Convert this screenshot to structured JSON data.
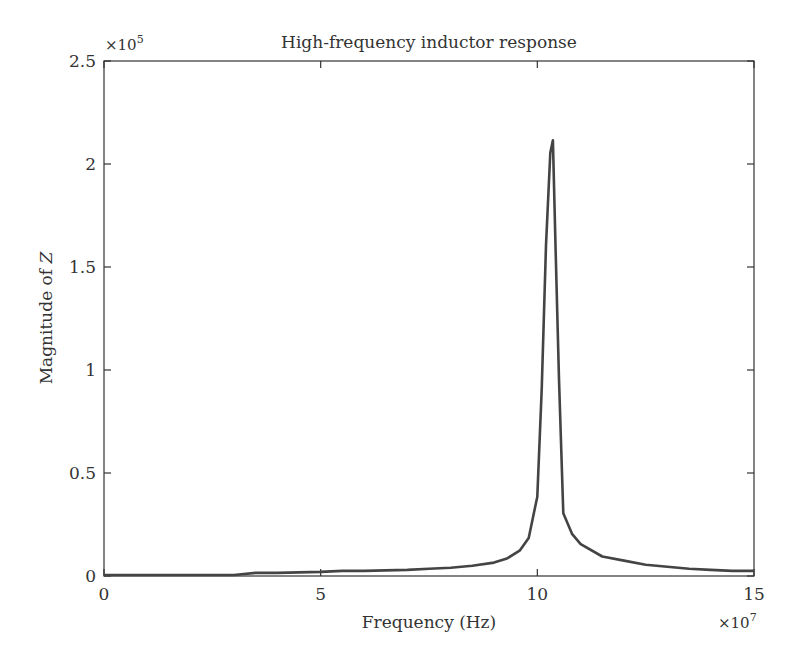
{
  "chart_data": {
    "type": "line",
    "title": "High-frequency inductor response",
    "xlabel": "Frequency (Hz)",
    "ylabel": "Magnitude of Z",
    "x_multiplier": "×10^7",
    "y_multiplier": "×10^5",
    "x_multiplier_base": "×10",
    "x_multiplier_exp": "7",
    "y_multiplier_base": "×10",
    "y_multiplier_exp": "5",
    "xlim": [
      0,
      15
    ],
    "ylim": [
      0,
      2.5
    ],
    "xticks": [
      "0",
      "5",
      "10",
      "15"
    ],
    "yticks": [
      "0",
      "0.5",
      "1",
      "1.5",
      "2",
      "2.5"
    ],
    "grid": false,
    "legend": null,
    "line_color": "#444444",
    "series": [
      {
        "name": "|Z|",
        "x": [
          0,
          1,
          2,
          3,
          3.5,
          4,
          5,
          5.5,
          6,
          7,
          7.5,
          8,
          8.5,
          9,
          9.3,
          9.6,
          9.8,
          10,
          10.1,
          10.2,
          10.3,
          10.36,
          10.42,
          10.5,
          10.6,
          10.8,
          11,
          11.5,
          12,
          12.5,
          13,
          13.5,
          14,
          14.5,
          15
        ],
        "values": [
          0.0,
          0.0,
          0.0,
          0.0,
          0.01,
          0.01,
          0.015,
          0.02,
          0.02,
          0.025,
          0.03,
          0.035,
          0.045,
          0.06,
          0.08,
          0.12,
          0.18,
          0.38,
          0.9,
          1.6,
          2.05,
          2.11,
          1.6,
          0.95,
          0.3,
          0.2,
          0.15,
          0.09,
          0.07,
          0.05,
          0.04,
          0.03,
          0.025,
          0.02,
          0.02
        ]
      }
    ]
  }
}
